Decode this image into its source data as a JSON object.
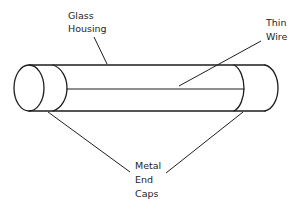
{
  "diagram": {
    "colors": {
      "line": "#1e1e1e",
      "background": "#ffffff"
    },
    "labels": {
      "glass_housing": {
        "line1": "Glass",
        "line2": "Housing"
      },
      "thin_wire": {
        "line1": "Thin",
        "line2": "Wire"
      },
      "metal_end_caps": {
        "line1": "Metal",
        "line2": "End",
        "line3": "Caps"
      }
    }
  }
}
